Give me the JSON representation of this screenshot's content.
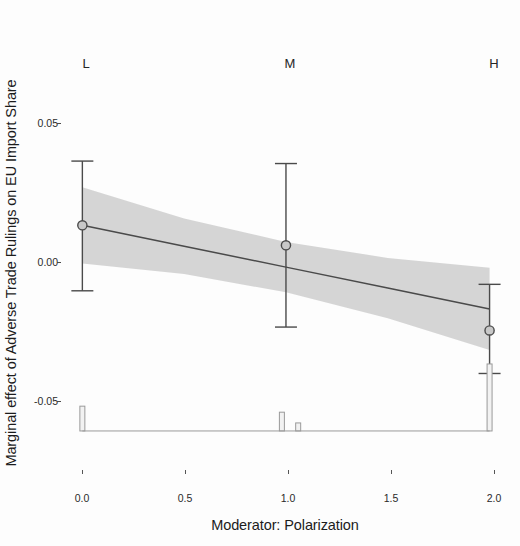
{
  "chart_data": {
    "type": "line",
    "title": "",
    "subtitle": "",
    "xlabel": "Moderator: Polarization",
    "ylabel": "Marginal effect of Adverse Trade Rulings on EU Import Share",
    "xlim": [
      -0.1,
      2.12
    ],
    "ylim": [
      -0.072,
      0.077
    ],
    "grid": false,
    "legend": null,
    "x_ticks": [
      "0.0",
      "0.5",
      "1.0",
      "1.5",
      "2.0"
    ],
    "x_tick_values": [
      0.0,
      0.5,
      1.0,
      1.5,
      2.0
    ],
    "y_ticks": [
      "0.05",
      "0.00",
      "-0.05"
    ],
    "y_tick_values": [
      0.05,
      0.0,
      -0.05
    ],
    "series": [
      {
        "name": "Marginal effect (fitted line)",
        "type": "line",
        "color": "#4a4a4a",
        "x": [
          0.0,
          0.5,
          1.0,
          1.5,
          2.0
        ],
        "values": [
          0.0076,
          0.0008,
          -0.006,
          -0.0128,
          -0.0196
        ]
      },
      {
        "name": "95% confidence band",
        "type": "area",
        "color": "#b4b4b4",
        "x": [
          0.0,
          0.5,
          1.0,
          1.5,
          2.0
        ],
        "upper": [
          0.02,
          0.0098,
          0.0022,
          -0.003,
          -0.0062
        ],
        "lower": [
          -0.0048,
          -0.0082,
          -0.0142,
          -0.0226,
          -0.033
        ]
      },
      {
        "name": "Marginal effect point estimates",
        "type": "scatter",
        "color": "#5a5a5a",
        "x": [
          0.0,
          1.0,
          2.0
        ],
        "values": [
          0.0076,
          0.0011,
          -0.0266
        ],
        "error_high": [
          0.0285,
          0.0277,
          -0.0116
        ],
        "error_low": [
          -0.0137,
          -0.0255,
          -0.0406
        ]
      },
      {
        "name": "Observation density (rug histogram)",
        "type": "bar",
        "color": "#9a9a9a",
        "x": [
          0.0,
          0.98,
          1.06,
          2.0
        ],
        "values": [
          0.37,
          0.28,
          0.12,
          1.0
        ]
      }
    ],
    "annotations": [
      {
        "text": "L",
        "x": 0.0,
        "y": 0.068
      },
      {
        "text": "M",
        "x": 1.0,
        "y": 0.068
      },
      {
        "text": "H",
        "x": 2.0,
        "y": 0.068
      }
    ]
  },
  "axis": {
    "y_label": "Marginal effect of Adverse Trade Rulings on EU Import Share",
    "x_label": "Moderator: Polarization",
    "y_tick_0": "0.05",
    "y_tick_1": "0.00",
    "y_tick_2": "-0.05",
    "x_tick_0": "0.0",
    "x_tick_1": "0.5",
    "x_tick_2": "1.0",
    "x_tick_3": "1.5",
    "x_tick_4": "2.0"
  },
  "groups": {
    "low": "L",
    "mid": "M",
    "high": "H"
  },
  "colors": {
    "line": "#4a4a4a",
    "band": "#b9b9b9",
    "point_fill": "#c8c8c8",
    "point_stroke": "#4a4a4a",
    "errorbar": "#4a4a4a",
    "histogram": "#9a9a9a",
    "panel_background": "#fdfdfd",
    "text": "#1c1c1c"
  }
}
